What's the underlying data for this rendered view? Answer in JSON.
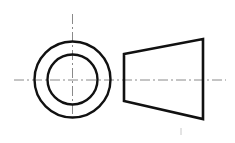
{
  "drawing": {
    "title": "Truncated cone orthographic views",
    "colors": {
      "background": "#ffffff",
      "outline": "#111111",
      "centerline": "#8a8a8a",
      "artifact": "#c8c8c8"
    },
    "circular_view": {
      "center": [
        72.5,
        79.5
      ],
      "outer_radius": 38,
      "inner_radius": 25,
      "stroke_width": 2.4,
      "vertical_centerline": {
        "x": 72.5,
        "y1": 14,
        "y2": 118
      }
    },
    "side_view": {
      "points": [
        [
          124,
          54
        ],
        [
          203,
          39
        ],
        [
          203,
          119
        ],
        [
          124,
          101
        ]
      ],
      "stroke_width": 2.6
    },
    "horizontal_centerline": {
      "y": 80,
      "x1": 14,
      "x2": 226,
      "dash": "10 3 2 3"
    },
    "artifact_tick": {
      "x": 181,
      "y1": 128,
      "y2": 135
    }
  }
}
